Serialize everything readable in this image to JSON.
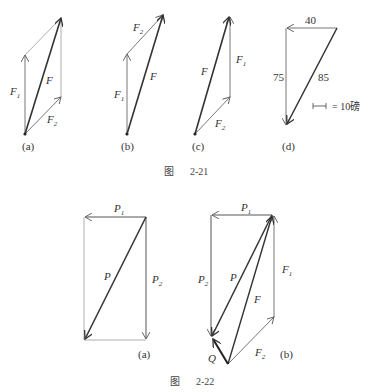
{
  "figure_2_21": {
    "caption_prefix": "图",
    "caption_number": "2-21",
    "panels": [
      {
        "id": "a",
        "label": "(a)",
        "vectors": [
          "F1",
          "F2",
          "F"
        ]
      },
      {
        "id": "b",
        "label": "(b)",
        "vectors": [
          "F1",
          "F2",
          "F"
        ]
      },
      {
        "id": "c",
        "label": "(c)",
        "vectors": [
          "F",
          "F1",
          "F2"
        ]
      },
      {
        "id": "d",
        "label": "(d)",
        "values": {
          "top": "40",
          "left": "75",
          "diagonal": "85"
        },
        "scale": "= 10磅"
      }
    ],
    "labels": {
      "F": "F",
      "F1_main": "F",
      "F1_sub": "1",
      "F2_main": "F",
      "F2_sub": "2"
    }
  },
  "figure_2_22": {
    "caption_prefix": "图",
    "caption_number": "2-22",
    "panels": [
      {
        "id": "a",
        "label": "(a)",
        "vectors": [
          "P1",
          "P2",
          "P"
        ]
      },
      {
        "id": "b",
        "label": "(b)",
        "vectors": [
          "P1",
          "P2",
          "P",
          "F1",
          "F2",
          "F",
          "Q"
        ]
      }
    ],
    "labels": {
      "P": "P",
      "P1_main": "P",
      "P1_sub": "1",
      "P2_main": "P",
      "P2_sub": "2",
      "F": "F",
      "F1_main": "F",
      "F1_sub": "1",
      "F2_main": "F",
      "F2_sub": "2",
      "Q": "Q"
    }
  },
  "colors": {
    "thin_line": "#777777",
    "thick_line": "#333333",
    "text": "#333333"
  }
}
